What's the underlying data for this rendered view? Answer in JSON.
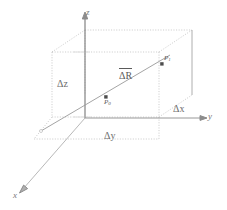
{
  "figure": {
    "type": "3d-coordinate-box-diagram",
    "background_color": "#ffffff",
    "line_color_solid": "#8c8c8c",
    "line_color_dotted": "#b8b8b8",
    "line_color_diagonal": "#9a9a9a",
    "text_color": "#6a6a6a"
  },
  "axes": [
    {
      "name": "z-axis",
      "label": "z",
      "direction": "up",
      "style": "solid-with-arrow"
    },
    {
      "name": "y-axis",
      "label": "y",
      "direction": "right",
      "style": "solid-with-arrow"
    },
    {
      "name": "x-axis",
      "label": "x",
      "direction": "down-left",
      "style": "solid-with-arrow"
    }
  ],
  "dimension_labels": {
    "delta_z": "Δz",
    "delta_y": "Δy",
    "delta_x": "Δx"
  },
  "points": [
    {
      "name": "point-p0",
      "label": "P",
      "subscript": "0",
      "position": "lower-left-interior"
    },
    {
      "name": "point-p1",
      "label": "P",
      "subscript": "1",
      "position": "upper-right-interior"
    }
  ],
  "vector": {
    "name": "displacement-vector",
    "label": "ΔR",
    "notation": "overbar-vector",
    "description": "diagonal from P0 to P1"
  }
}
